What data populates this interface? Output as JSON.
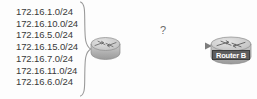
{
  "diagram": {
    "background_color": "#fdfdfd",
    "networks": {
      "label": "advertised networks",
      "items": [
        "172.16.1.0/24",
        "172.16.10.0/24",
        "172.16.5.0/24",
        "172.16.15.0/24",
        "172.16.7.0/24",
        "172.16.11.0/24",
        "172.16.6.0/24"
      ]
    },
    "brace": {
      "icon": "curly-brace-icon",
      "orientation": "right-pointing"
    },
    "nodes": [
      {
        "id": "router-a",
        "icon": "router-icon",
        "label": "",
        "has_label_band": false
      },
      {
        "id": "router-b",
        "icon": "router-icon",
        "label": "Router B",
        "has_label_band": true,
        "label_background": "#5e5e5e",
        "label_color": "#ffffff"
      }
    ],
    "link": {
      "from": "router-a",
      "to": "router-b",
      "annotation": "?",
      "arrow_direction": "right",
      "line_color": "#8a8a8a",
      "style": "double-line-with-arrowhead"
    },
    "colors": {
      "text": "#3a3a3a",
      "router_fill": "#b9b9b9",
      "router_stroke": "#7a7a7a",
      "line": "#8a8a8a",
      "annotation": "#6b6b6b"
    }
  }
}
